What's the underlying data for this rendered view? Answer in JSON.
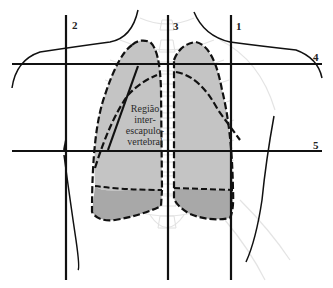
{
  "diagram": {
    "title": "",
    "lines": [
      {
        "id": "1",
        "label": "1",
        "orientation": "vertical",
        "position": "right midclavicular / scapular line"
      },
      {
        "id": "2",
        "label": "2",
        "orientation": "vertical",
        "position": "left scapular line"
      },
      {
        "id": "3",
        "label": "3",
        "orientation": "vertical",
        "position": "vertebral midline"
      },
      {
        "id": "4",
        "label": "4",
        "orientation": "horizontal",
        "position": "upper horizontal line"
      },
      {
        "id": "5",
        "label": "5",
        "orientation": "horizontal",
        "position": "lower horizontal line"
      }
    ],
    "region_label": {
      "line1": "Região",
      "line2": "inter-",
      "line3": "escapulo-",
      "line4": "vertebral"
    },
    "colors": {
      "lung_fill": "#c2c2c2",
      "lung_base_fill": "#a9a9a9",
      "lines": "#111111",
      "ribs": "#e6e6e6"
    }
  }
}
